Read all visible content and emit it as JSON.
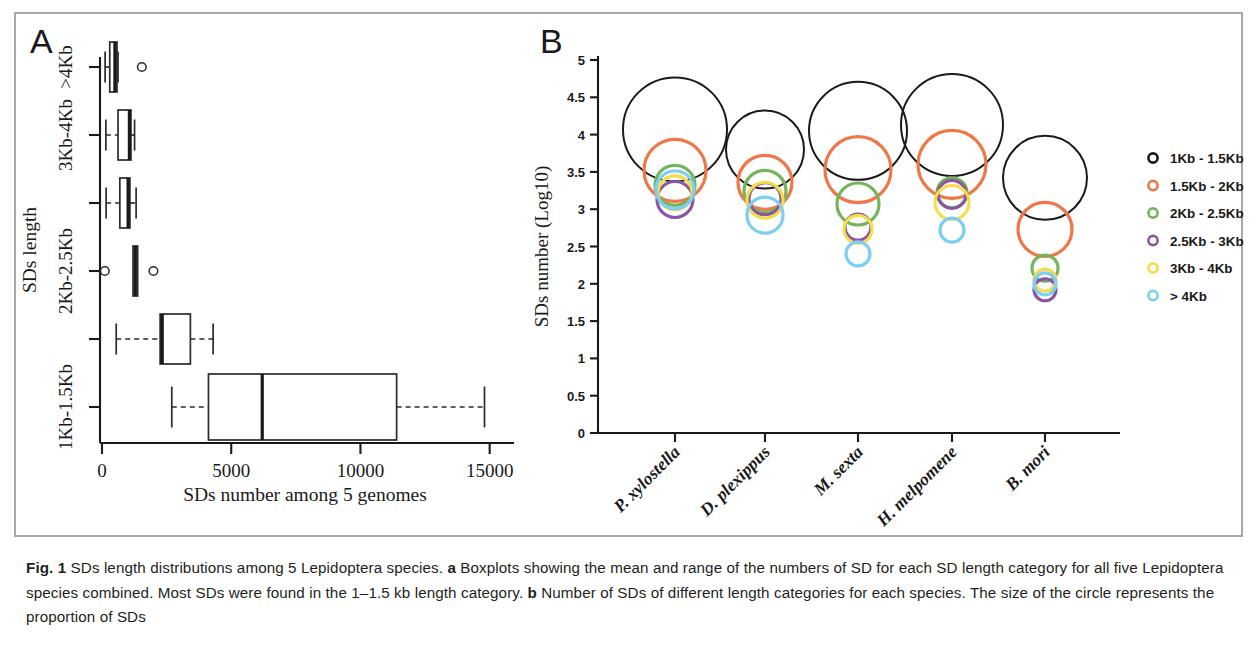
{
  "figure": {
    "panel_a_letter": "A",
    "panel_b_letter": "B"
  },
  "caption": {
    "label": "Fig. 1",
    "line1_a": " SDs length distributions among 5 Lepidoptera species. ",
    "bold_a": "a",
    "line1_b": " Boxplots showing the mean and range of the numbers of SD for each SD length category for all five Lepidoptera species combined. Most SDs were found in the 1–1.5 kb length category. ",
    "bold_b": "b",
    "line1_c": " Number of SDs of different length categories for each species. The size of the circle represents the proportion of SDs"
  },
  "chart_data": [
    {
      "type": "boxplot",
      "panel": "A",
      "title": "",
      "xlabel": "SDs number among 5 genomes",
      "ylabel": "SDs length",
      "xlim": [
        0,
        15400
      ],
      "xticks": [
        0,
        5000,
        10000,
        15000
      ],
      "xtick_labels": [
        "0",
        "5000",
        "10000",
        "15000"
      ],
      "grid": false,
      "orientation": "horizontal",
      "categories": [
        "1Kb-1.5Kb",
        "2Kb-2.5Kb",
        "3Kb-4Kb",
        ">4Kb"
      ],
      "ytick_labels": [
        "1Kb-1.5Kb",
        "2Kb-2.5Kb",
        "3Kb-4Kb",
        ">4Kb"
      ],
      "boxes": [
        {
          "category": "1Kb-1.5Kb",
          "row": 0,
          "whisker_low": 2700,
          "q1": 4120,
          "median": 6200,
          "q3": 11400,
          "whisker_high": 14800,
          "outliers": []
        },
        {
          "category": "1.5Kb-2Kb",
          "row": 1,
          "whisker_low": 550,
          "q1": 2250,
          "median": 2330,
          "q3": 3420,
          "whisker_high": 4300,
          "outliers": []
        },
        {
          "category": "2Kb-2.5Kb",
          "row": 2,
          "whisker_low": 1200,
          "q1": 1200,
          "median": 1290,
          "q3": 1380,
          "whisker_high": 1380,
          "outliers": [
            110,
            1990
          ]
        },
        {
          "category": "2.5Kb-3Kb",
          "row": 3,
          "whisker_low": 160,
          "q1": 690,
          "median": 1010,
          "q3": 1080,
          "whisker_high": 1320,
          "outliers": []
        },
        {
          "category": "3Kb-4Kb",
          "row": 4,
          "whisker_low": 150,
          "q1": 620,
          "median": 1060,
          "q3": 1120,
          "whisker_high": 1260,
          "outliers": []
        },
        {
          "category": ">4Kb",
          "row": 5,
          "whisker_low": 120,
          "q1": 300,
          "median": 500,
          "q3": 580,
          "whisker_high": 620,
          "outliers": [
            1540
          ]
        }
      ]
    },
    {
      "type": "bubble",
      "panel": "B",
      "title": "",
      "xlabel": "",
      "ylabel": "SDs number (Log10)",
      "ylim": [
        0,
        5
      ],
      "yticks": [
        0,
        0.5,
        1,
        1.5,
        2,
        2.5,
        3,
        3.5,
        4,
        4.5,
        5
      ],
      "ytick_labels": [
        "0",
        "0.5",
        "1",
        "1.5",
        "2",
        "2.5",
        "3",
        "3.5",
        "4",
        "4.5",
        "5"
      ],
      "grid": false,
      "legend_position": "right",
      "categories": [
        "P. xylostella",
        "D. plexippus",
        "M. sexta",
        "H. melpomene",
        "B. mori"
      ],
      "series": [
        {
          "name": "1Kb - 1.5Kb",
          "color": "#1a1a1a",
          "values": [
            4.07,
            3.8,
            4.05,
            4.13,
            3.42
          ],
          "radii": [
            52,
            39,
            49,
            51,
            42
          ]
        },
        {
          "name": "1.5Kb - 2Kb",
          "color": "#ef7748",
          "values": [
            3.52,
            3.36,
            3.53,
            3.6,
            2.73
          ],
          "radii": [
            31,
            27,
            33,
            34,
            27
          ]
        },
        {
          "name": "2Kb - 2.5Kb",
          "color": "#74b45c",
          "values": [
            3.32,
            3.24,
            3.07,
            3.22,
            2.21
          ],
          "radii": [
            20,
            21,
            21,
            15,
            13
          ]
        },
        {
          "name": "2.5Kb - 3Kb",
          "color": "#8b55a2",
          "values": [
            3.13,
            3.14,
            2.76,
            3.2,
            1.92
          ],
          "radii": [
            18,
            16,
            13,
            14,
            11
          ]
        },
        {
          "name": "3Kb - 4Kb",
          "color": "#f4dc4a",
          "values": [
            3.22,
            3.12,
            2.73,
            3.09,
            2.05
          ],
          "radii": [
            17,
            18,
            14,
            17,
            11
          ]
        },
        {
          "name": "> 4Kb",
          "color": "#7ecdf2",
          "values": [
            3.26,
            2.92,
            2.4,
            2.72,
            2.0
          ],
          "radii": [
            19,
            18,
            12,
            12,
            11
          ]
        }
      ],
      "legend_entries": [
        {
          "label": "1Kb - 1.5Kb",
          "color": "#1a1a1a"
        },
        {
          "label": "1.5Kb - 2Kb",
          "color": "#ef7748"
        },
        {
          "label": "2Kb - 2.5Kb",
          "color": "#74b45c"
        },
        {
          "label": "2.5Kb - 3Kb",
          "color": "#8b55a2"
        },
        {
          "label": "3Kb - 4Kb",
          "color": "#f4dc4a"
        },
        {
          "label": "> 4Kb",
          "color": "#7ecdf2"
        }
      ]
    }
  ]
}
